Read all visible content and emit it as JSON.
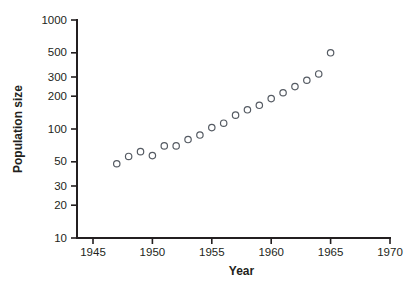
{
  "chart_data": {
    "type": "scatter",
    "title": "",
    "xlabel": "Year",
    "ylabel": "Population size",
    "xlim": [
      1945,
      1970
    ],
    "ylim": [
      10,
      1000
    ],
    "yscale": "log",
    "xscale": "linear",
    "grid": false,
    "legend": null,
    "xticks": [
      1945,
      1950,
      1955,
      1960,
      1965,
      1970
    ],
    "xtick_labels": [
      "1945",
      "1950",
      "1955",
      "1960",
      "1965",
      "1970"
    ],
    "yticks": [
      10,
      20,
      30,
      50,
      100,
      200,
      300,
      500,
      1000
    ],
    "ytick_labels": [
      "10",
      "20",
      "30",
      "50",
      "100",
      "200",
      "300",
      "500",
      "1000"
    ],
    "marker": "open-circle",
    "marker_color": "#555b63",
    "x": [
      1947,
      1948,
      1949,
      1950,
      1951,
      1952,
      1953,
      1954,
      1955,
      1956,
      1957,
      1958,
      1959,
      1960,
      1961,
      1962,
      1963,
      1964,
      1965
    ],
    "values": [
      48,
      56,
      62,
      57,
      70,
      70,
      80,
      88,
      103,
      113,
      134,
      150,
      165,
      190,
      215,
      245,
      280,
      320,
      500
    ],
    "series": [
      {
        "name": "Population size",
        "points": [
          {
            "x": 1947,
            "y": 48
          },
          {
            "x": 1948,
            "y": 56
          },
          {
            "x": 1949,
            "y": 62
          },
          {
            "x": 1950,
            "y": 57
          },
          {
            "x": 1951,
            "y": 70
          },
          {
            "x": 1952,
            "y": 70
          },
          {
            "x": 1953,
            "y": 80
          },
          {
            "x": 1954,
            "y": 88
          },
          {
            "x": 1955,
            "y": 103
          },
          {
            "x": 1956,
            "y": 113
          },
          {
            "x": 1957,
            "y": 134
          },
          {
            "x": 1958,
            "y": 150
          },
          {
            "x": 1959,
            "y": 165
          },
          {
            "x": 1960,
            "y": 190
          },
          {
            "x": 1961,
            "y": 215
          },
          {
            "x": 1962,
            "y": 245
          },
          {
            "x": 1963,
            "y": 280
          },
          {
            "x": 1964,
            "y": 320
          },
          {
            "x": 1965,
            "y": 500
          }
        ]
      }
    ]
  }
}
